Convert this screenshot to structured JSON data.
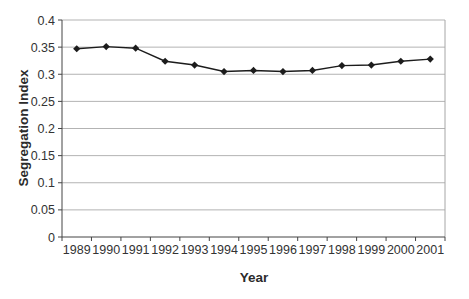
{
  "chart_data": {
    "type": "line",
    "title": "",
    "xlabel": "Year",
    "ylabel": "Segregation Index",
    "categories": [
      "1989",
      "1990",
      "1991",
      "1992",
      "1993",
      "1994",
      "1995",
      "1996",
      "1997",
      "1998",
      "1999",
      "2000",
      "2001"
    ],
    "series": [
      {
        "name": "Segregation Index",
        "values": [
          0.347,
          0.351,
          0.348,
          0.324,
          0.317,
          0.305,
          0.307,
          0.305,
          0.307,
          0.316,
          0.317,
          0.324,
          0.328
        ]
      }
    ],
    "ylim": [
      0,
      0.4
    ],
    "ytick_step": 0.05,
    "ytick_labels": [
      "0",
      "0.05",
      "0.1",
      "0.15",
      "0.2",
      "0.25",
      "0.3",
      "0.35",
      "0.4"
    ],
    "grid": "horizontal",
    "legend": "none",
    "marker": "diamond",
    "colors": {
      "series": "#1c1c1c",
      "gridline": "#b3b3b3",
      "plot_border": "#a6a6a6",
      "axis": "#444444",
      "text": "#333333",
      "background": "#ffffff"
    }
  }
}
